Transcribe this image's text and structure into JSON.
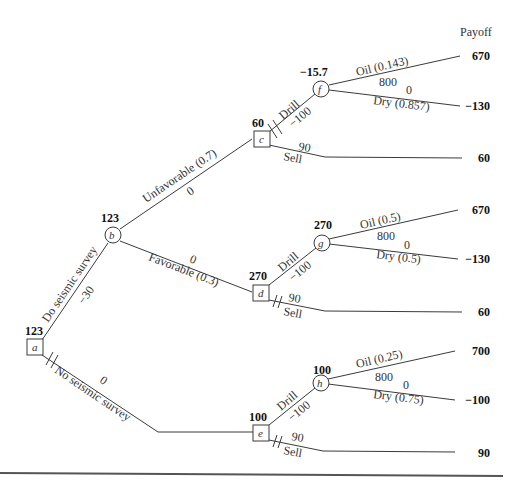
{
  "header": {
    "payoff_label": "Payoff"
  },
  "nodes": {
    "a": {
      "id": "a",
      "type": "decision",
      "value": "123"
    },
    "b": {
      "id": "b",
      "type": "chance",
      "value": "123"
    },
    "c": {
      "id": "c",
      "type": "decision",
      "value": "60"
    },
    "d": {
      "id": "d",
      "type": "decision",
      "value": "270"
    },
    "e": {
      "id": "e",
      "type": "decision",
      "value": "100"
    },
    "f": {
      "id": "f",
      "type": "chance",
      "value": "−15.7"
    },
    "g": {
      "id": "g",
      "type": "chance",
      "value": "270"
    },
    "h": {
      "id": "h",
      "type": "chance",
      "value": "100"
    }
  },
  "branches": {
    "a_b": {
      "label": "Do seismic survey",
      "cost": "−30"
    },
    "a_e": {
      "label": "No seismic survey",
      "cost": "0"
    },
    "b_c": {
      "label": "Unfavorable (0.7)",
      "cost": "0"
    },
    "b_d": {
      "label": "Favorable (0.3)",
      "cost": "0"
    },
    "c_f": {
      "label": "Drill",
      "cost": "−100"
    },
    "c_sell": {
      "label": "Sell",
      "cost": "90"
    },
    "f_oil": {
      "label": "Oil (0.143)",
      "cost": "800"
    },
    "f_dry": {
      "label": "Dry (0.857)",
      "cost": "0"
    },
    "d_g": {
      "label": "Drill",
      "cost": "−100"
    },
    "d_sell": {
      "label": "Sell",
      "cost": "90"
    },
    "g_oil": {
      "label": "Oil (0.5)",
      "cost": "800"
    },
    "g_dry": {
      "label": "Dry (0.5)",
      "cost": "0"
    },
    "e_h": {
      "label": "Drill",
      "cost": "−100"
    },
    "e_sell": {
      "label": "Sell",
      "cost": "90"
    },
    "h_oil": {
      "label": "Oil (0.25)",
      "cost": "800"
    },
    "h_dry": {
      "label": "Dry (0.75)",
      "cost": "0"
    }
  },
  "payoffs": [
    "670",
    "−130",
    "60",
    "670",
    "−130",
    "60",
    "700",
    "−100",
    "90"
  ]
}
